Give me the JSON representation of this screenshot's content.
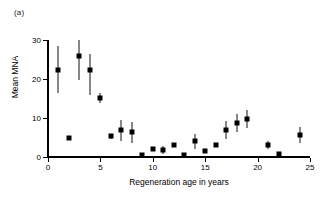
{
  "panel": {
    "label": "(a)"
  },
  "chart_data": {
    "type": "scatter",
    "title": "",
    "subtitle": "",
    "xlabel": "Regeneration age in years",
    "ylabel": "Mean MNA",
    "xlim": [
      0,
      25
    ],
    "ylim": [
      0,
      30
    ],
    "xticks": [
      0,
      5,
      10,
      15,
      20,
      25
    ],
    "yticks": [
      0,
      10,
      20,
      30
    ],
    "xticklabels": [
      "0",
      "5",
      "10",
      "15",
      "20",
      "25"
    ],
    "yticklabels": [
      "0",
      "10",
      "20",
      "30"
    ],
    "grid": false,
    "legend": null,
    "marker": "filled-square",
    "error_bars": "vertical",
    "series": [
      {
        "name": "Mean MNA",
        "x": [
          1,
          2,
          3,
          4,
          5,
          6,
          7,
          8,
          9,
          10,
          11,
          12,
          13,
          14,
          15,
          16,
          17,
          18,
          19,
          21,
          22,
          24
        ],
        "y": [
          22.4,
          4.8,
          26.0,
          22.3,
          15.1,
          5.3,
          6.8,
          6.3,
          0.6,
          2.0,
          1.8,
          3.1,
          0.4,
          4.0,
          1.6,
          3.2,
          7.0,
          8.8,
          9.7,
          3.1,
          0.8,
          5.6
        ],
        "yerr_low": [
          6.0,
          0.0,
          6.2,
          6.5,
          1.3,
          0.6,
          2.7,
          2.6,
          0.0,
          0.0,
          1.0,
          0.0,
          0.0,
          1.9,
          0.0,
          0.0,
          2.3,
          2.3,
          2.3,
          1.0,
          0.0,
          2.0
        ],
        "yerr_high": [
          6.0,
          0.0,
          4.0,
          4.0,
          1.3,
          0.6,
          2.7,
          2.6,
          0.0,
          0.0,
          1.0,
          0.0,
          0.0,
          1.9,
          0.0,
          0.0,
          2.3,
          2.3,
          2.3,
          1.0,
          0.0,
          2.0
        ]
      }
    ]
  },
  "colors": {
    "marker": "#000000",
    "axis": "#000000",
    "background": "#ffffff"
  }
}
